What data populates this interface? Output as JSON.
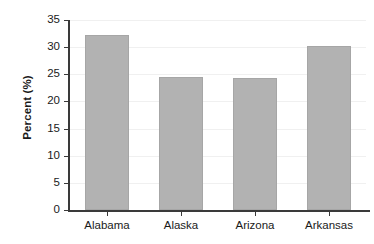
{
  "chart_data": {
    "type": "bar",
    "title": "",
    "subtitle": "",
    "xlabel": "",
    "ylabel": "Percent (%)",
    "categories": [
      "Alabama",
      "Alaska",
      "Arizona",
      "Arkansas"
    ],
    "values": [
      32.2,
      24.5,
      24.3,
      30.2
    ],
    "series": [
      {
        "name": "Percent",
        "values": [
          32.2,
          24.5,
          24.3,
          30.2
        ]
      }
    ],
    "ylim": [
      0,
      35
    ],
    "xlim": [
      0,
      4
    ],
    "y_ticks": [
      0,
      5,
      10,
      15,
      20,
      25,
      30,
      35
    ],
    "y_tick_labels": [
      "0",
      "5",
      "10",
      "15",
      "20",
      "25",
      "30",
      "35"
    ],
    "grid": "horizontal",
    "legend": "none",
    "legend_position": "",
    "annotations": [],
    "colors": {
      "bar_fill": "#b2b2b2",
      "bar_edge": "#a6a6a6",
      "axis": "#3a3a3a",
      "grid": "#f0f0f0",
      "text": "#1a1a1a",
      "background": "#ffffff"
    }
  }
}
